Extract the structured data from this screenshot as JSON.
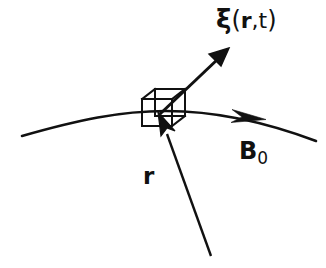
{
  "figure": {
    "type": "physics-vector-diagram",
    "width": 326,
    "height": 268,
    "background_color": "#ffffff",
    "stroke_color": "#111111"
  },
  "labels": {
    "displacement": {
      "name": "xi-label",
      "xi_symbol": "ξ",
      "open_paren": "(",
      "position_vector": "r",
      "comma": ",",
      "time": "t",
      "close_paren": ")",
      "full_text": "ξ(r,t)"
    },
    "magnetic_field": {
      "name": "b0-label",
      "symbol": "B",
      "subscript": "0",
      "full_text": "B0"
    },
    "position": {
      "name": "r-label",
      "symbol": "r",
      "full_text": "r"
    }
  },
  "elements": {
    "field_line": {
      "name": "magnetic-field-line",
      "description": "curved magnetic field line B0",
      "start": [
        22,
        136
      ],
      "control_left": [
        95,
        116
      ],
      "apex": [
        165,
        111
      ],
      "control_right": [
        250,
        118
      ],
      "end": [
        316,
        141
      ],
      "arrow_at": [
        258,
        118
      ],
      "stroke_width": 2.6
    },
    "fluid_element": {
      "name": "fluid-element-box",
      "description": "small cuboid fluid element drawn in oblique projection",
      "front_face": {
        "x": 142,
        "y": 99,
        "width": 30,
        "height": 27
      },
      "depth_offset": [
        13,
        -10
      ],
      "stroke_width": 2.0
    },
    "displacement_arrow": {
      "name": "displacement-vector-arrow",
      "description": "vector xi from fluid element pointing up-right",
      "tail": [
        160,
        114
      ],
      "tip": [
        228,
        49
      ],
      "stroke_width": 3.0,
      "head_length": 19,
      "head_width": 13
    },
    "position_arrow": {
      "name": "position-vector-arrow",
      "description": "position vector r from origin to fluid element",
      "tail": [
        211,
        256
      ],
      "tip": [
        159,
        113
      ],
      "stroke_width": 2.4,
      "head_length": 22,
      "head_width": 14
    }
  },
  "colors": {
    "ink": "#111111",
    "paper": "#ffffff"
  }
}
